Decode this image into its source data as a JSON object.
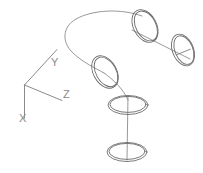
{
  "document": {
    "title": "3D Wireframe Sweep Construction",
    "background_color": "#ffffff",
    "width": 203,
    "height": 173
  },
  "axis_indicator": {
    "name": "ucs-axis-triad",
    "origin": {
      "x": 24,
      "y": 85
    },
    "stroke_color": "#8a8a8a",
    "axes": [
      {
        "label": "Y",
        "label_x": 53,
        "label_y": 62,
        "end_x": 57,
        "end_y": 49,
        "direction": "up-right"
      },
      {
        "label": "Z",
        "label_x": 64,
        "label_y": 97,
        "end_x": 62,
        "end_y": 100,
        "direction": "down-right"
      },
      {
        "label": "X",
        "label_x": 23,
        "label_y": 121,
        "end_x": 24,
        "end_y": 118,
        "direction": "down"
      }
    ]
  },
  "profiles": [
    {
      "name": "profile-circle-1",
      "description": "tilted circle, upper area",
      "cx": 145,
      "cy": 26,
      "rx": 11,
      "ry": 17,
      "rotation": -28,
      "double_outline": true,
      "center_mark": true
    },
    {
      "name": "profile-circle-2",
      "description": "tilted circle, upper right end",
      "cx": 183,
      "cy": 50,
      "rx": 10,
      "ry": 16,
      "rotation": -22,
      "double_outline": true,
      "center_mark": true
    },
    {
      "name": "profile-circle-3",
      "description": "tilted circle, middle left",
      "cx": 105,
      "cy": 72,
      "rx": 11,
      "ry": 17,
      "rotation": -30,
      "double_outline": true,
      "center_mark": true
    },
    {
      "name": "profile-circle-4",
      "description": "flat circle, lower middle",
      "cx": 128,
      "cy": 105,
      "rx": 19,
      "ry": 9,
      "rotation": 0,
      "double_outline": true,
      "center_mark": true
    },
    {
      "name": "profile-circle-5",
      "description": "flat circle, bottom",
      "cx": 127,
      "cy": 152,
      "rx": 19,
      "ry": 9,
      "rotation": 0,
      "double_outline": true,
      "center_mark": true
    }
  ],
  "path_segments": [
    {
      "name": "sweep-arc-upper",
      "type": "curve",
      "description": "arc sweeping from upper circle left and down to middle circle"
    },
    {
      "name": "axis-line-1-to-2",
      "type": "line",
      "description": "straight connector between circle 1 and circle 2",
      "x1": 138,
      "y1": 34,
      "x2": 189,
      "y2": 58
    },
    {
      "name": "axis-line-3-to-4",
      "type": "curve",
      "description": "connector from circle 3 down to circle 4"
    },
    {
      "name": "axis-line-4-to-5",
      "type": "line",
      "description": "vertical connector between circle 4 and circle 5",
      "x1": 128,
      "y1": 96,
      "x2": 127,
      "y2": 160
    }
  ],
  "colors": {
    "wire_stroke": "#6b6b6b",
    "axis_stroke": "#8a8a8a",
    "background": "#ffffff"
  }
}
